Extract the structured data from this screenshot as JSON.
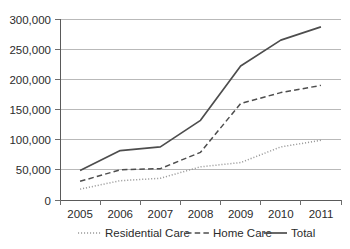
{
  "chart_data": {
    "type": "line",
    "title": "",
    "xlabel": "",
    "ylabel": "",
    "categories": [
      "2005",
      "2006",
      "2007",
      "2008",
      "2009",
      "2010",
      "2011"
    ],
    "ylim": [
      0,
      300000
    ],
    "yticks": [
      0,
      50000,
      100000,
      150000,
      200000,
      250000,
      300000
    ],
    "ytick_labels": [
      "0",
      "50,000",
      "100,000",
      "150,000",
      "200,000",
      "250,000",
      "300,000"
    ],
    "grid": true,
    "legend_position": "bottom",
    "series": [
      {
        "name": "Residential Care",
        "style": "dotted",
        "color": "#9a9a9a",
        "values": [
          18000,
          32000,
          36000,
          55000,
          62000,
          88000,
          99000
        ]
      },
      {
        "name": "Home Care",
        "style": "dashed",
        "color": "#4d4d4d",
        "values": [
          31000,
          50000,
          52000,
          79000,
          160000,
          178000,
          190000
        ]
      },
      {
        "name": "Total",
        "style": "solid",
        "color": "#4d4d4d",
        "values": [
          49000,
          82000,
          88000,
          132000,
          222000,
          265000,
          287000
        ]
      }
    ]
  },
  "axis": {
    "y_labels": [
      "300,000",
      "250,000",
      "200,000",
      "150,000",
      "100,000",
      "50,000",
      "0"
    ],
    "x_labels": [
      "2005",
      "2006",
      "2007",
      "2008",
      "2009",
      "2010",
      "2011"
    ]
  },
  "legend": {
    "items": [
      {
        "label": "Residential Care"
      },
      {
        "label": "Home Care"
      },
      {
        "label": "Total"
      }
    ]
  }
}
